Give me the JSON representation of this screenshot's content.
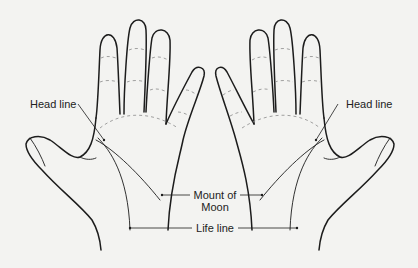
{
  "diagram": {
    "type": "palm-lines-illustration",
    "hands": [
      {
        "side": "left",
        "label": "left-hand"
      },
      {
        "side": "right",
        "label": "right-hand"
      }
    ],
    "labels": {
      "head_line_left": "Head line",
      "head_line_right": "Head line",
      "mount_of_moon_line1": "Mount of",
      "mount_of_moon_line2": "Moon",
      "life_line": "Life line"
    },
    "colors": {
      "background": "#f3f3f1",
      "ink": "#1c1c1c"
    }
  }
}
